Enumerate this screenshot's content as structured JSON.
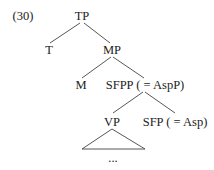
{
  "example_number": "(30)",
  "nodes": {
    "tp": "TP",
    "t": "T",
    "mp": "MP",
    "m": "M",
    "sfpp": "SFPP ( = AspP)",
    "vp": "VP",
    "sfp": "SFP ( = Asp)",
    "ellipsis": "..."
  }
}
